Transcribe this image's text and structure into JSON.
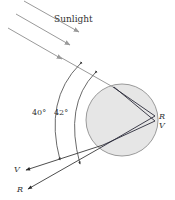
{
  "figure": {
    "title_label": "Sunlight",
    "angle_labels": {
      "violet_angle": "40°",
      "red_angle": "42°"
    },
    "ray_labels": {
      "internal_red": "R",
      "internal_violet": "V",
      "exit_violet": "V",
      "exit_red": "R"
    },
    "colors": {
      "background": "#ffffff",
      "drop_fill": "#e6e6e6",
      "drop_stroke": "#9a9a9a",
      "sunlight_ray": "#9a9a9a",
      "internal_ray": "#2b2b3a",
      "exit_ray": "#3a3a3a",
      "arc": "#444444",
      "text": "#333333"
    },
    "icons": {
      "sunlight_arrow": "arrow-down-right",
      "exit_arrow": "arrow-left"
    }
  }
}
